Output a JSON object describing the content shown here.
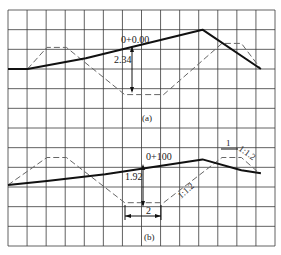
{
  "figure": {
    "panels": [
      {
        "id": "a",
        "caption": "(a)",
        "station_label": "0+0.00",
        "depth_label": "2.34",
        "ground_line": [
          [
            0,
            0.0
          ],
          [
            1,
            0.0
          ],
          [
            4,
            0.55
          ],
          [
            10,
            2.0
          ],
          [
            13,
            0.0
          ]
        ],
        "design_section": [
          [
            1,
            0.0
          ],
          [
            2,
            1.1
          ],
          [
            3,
            1.1
          ],
          [
            6,
            -1.3
          ],
          [
            8,
            -1.3
          ],
          [
            11,
            1.3
          ],
          [
            12,
            1.3
          ],
          [
            13,
            0.0
          ]
        ],
        "depth_marker_station": 7.0
      },
      {
        "id": "b",
        "caption": "(b)",
        "station_label": "0+100",
        "depth_label": "1.92",
        "width_label": "2",
        "berm_label": "1",
        "slope_label_left": "1:1.2",
        "slope_label_right": "1:1.2",
        "ground_line": [
          [
            0,
            0.0
          ],
          [
            2,
            0.2
          ],
          [
            5,
            0.55
          ],
          [
            10,
            1.3
          ],
          [
            12,
            0.75
          ],
          [
            13,
            0.6
          ]
        ],
        "design_section": [
          [
            0,
            0.0
          ],
          [
            2,
            1.4
          ],
          [
            3,
            1.4
          ],
          [
            6,
            -0.9
          ],
          [
            8,
            -0.9
          ],
          [
            11,
            1.4
          ],
          [
            12,
            1.4
          ],
          [
            12.8,
            0.7
          ]
        ],
        "depth_marker_station": 7.0
      }
    ]
  }
}
